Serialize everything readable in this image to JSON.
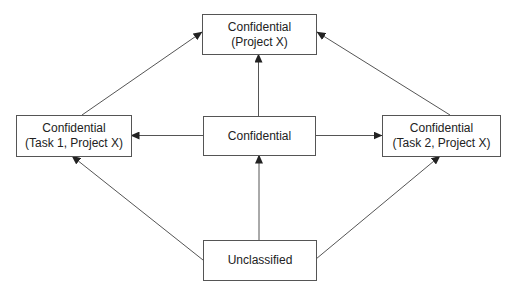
{
  "diagram": {
    "type": "security-lattice",
    "colors": {
      "line": "#555555",
      "text": "#222222",
      "background": "#ffffff"
    },
    "nodes": {
      "top": {
        "line1": "Confidential",
        "line2": "(Project X)"
      },
      "left": {
        "line1": "Confidential",
        "line2": "(Task 1, Project X)"
      },
      "middle": {
        "line1": "Confidential"
      },
      "right": {
        "line1": "Confidential",
        "line2": "(Task 2, Project X)"
      },
      "bottom": {
        "line1": "Unclassified"
      }
    },
    "edges": [
      {
        "from": "left",
        "to": "top"
      },
      {
        "from": "middle",
        "to": "top"
      },
      {
        "from": "right",
        "to": "top"
      },
      {
        "from": "middle",
        "to": "left"
      },
      {
        "from": "middle",
        "to": "right"
      },
      {
        "from": "bottom",
        "to": "left"
      },
      {
        "from": "bottom",
        "to": "middle"
      },
      {
        "from": "bottom",
        "to": "right"
      }
    ]
  }
}
